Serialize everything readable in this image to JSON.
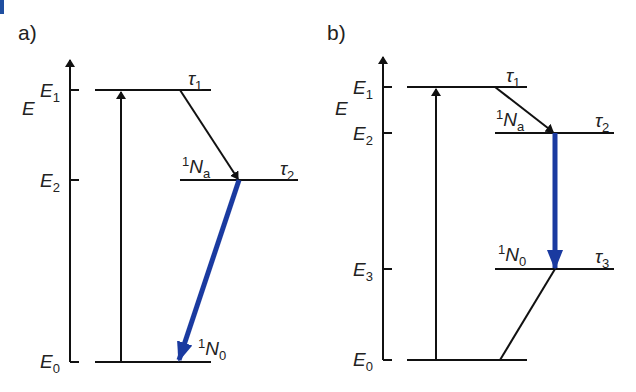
{
  "diagram": {
    "panels": [
      {
        "label": "a)",
        "axis_label": "E",
        "levels": [
          {
            "name": "E",
            "sub": "1",
            "tau": "τ",
            "tau_sub": "1"
          },
          {
            "name": "E",
            "sub": "2",
            "tau": "τ",
            "tau_sub": "2",
            "pop": "N",
            "pop_pre": "1",
            "pop_sub": "a"
          },
          {
            "name": "E",
            "sub": "0",
            "pop": "N",
            "pop_pre": "1",
            "pop_sub": "0"
          }
        ]
      },
      {
        "label": "b)",
        "axis_label": "E",
        "levels": [
          {
            "name": "E",
            "sub": "1",
            "tau": "τ",
            "tau_sub": "1"
          },
          {
            "name": "E",
            "sub": "2",
            "tau": "τ",
            "tau_sub": "2",
            "pop": "N",
            "pop_pre": "1",
            "pop_sub": "a"
          },
          {
            "name": "E",
            "sub": "3",
            "tau": "τ",
            "tau_sub": "3",
            "pop": "N",
            "pop_pre": "1",
            "pop_sub": "0"
          },
          {
            "name": "E",
            "sub": "0"
          }
        ]
      }
    ],
    "colors": {
      "line": "#111111",
      "laser_arrow": "#1a3aa0",
      "corner_mark": "#1f4fa0"
    }
  }
}
